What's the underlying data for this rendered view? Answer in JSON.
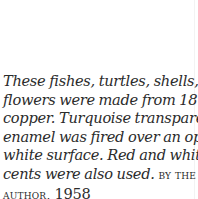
{
  "caption": {
    "lines": [
      "These fishes, turtles, shells, and",
      "flowers were made from 18 gauge",
      "copper. Turquoise transparent",
      "enamel was fired over an opaque",
      "white surface. Red and white ac-",
      "cents were also used."
    ],
    "credit_part1": "BY THE",
    "credit_part2": "AUTHOR,",
    "year": "1958"
  }
}
